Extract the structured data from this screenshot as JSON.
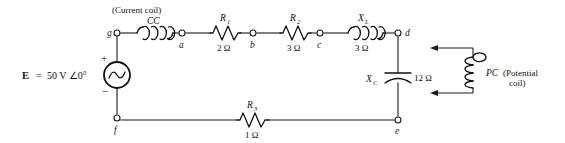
{
  "diagram": {
    "source": {
      "symbol_name": "ac-voltage-source",
      "label_e": "E",
      "label_equals": "=",
      "value": "50 V ∠0°",
      "plus_sign": "+",
      "minus_sign": "−"
    },
    "components": [
      {
        "id": "cc",
        "kind": "inductor",
        "label": "CC",
        "caption": "(Current coil)",
        "value": ""
      },
      {
        "id": "r1",
        "kind": "resistor",
        "label": "R",
        "subscript": "1",
        "value": "2 Ω"
      },
      {
        "id": "r2",
        "kind": "resistor",
        "label": "R",
        "subscript": "2",
        "value": "3 Ω"
      },
      {
        "id": "xl",
        "kind": "inductor",
        "label": "X",
        "subscript": "L",
        "value": "3 Ω"
      },
      {
        "id": "xc",
        "kind": "capacitor",
        "label": "X",
        "subscript": "C",
        "value": "12 Ω"
      },
      {
        "id": "r3",
        "kind": "resistor",
        "label": "R",
        "subscript": "3",
        "value": "1 Ω"
      },
      {
        "id": "pc",
        "kind": "inductor",
        "label": "PC",
        "caption_line1": "(Potential",
        "caption_line2": "coil)",
        "value": ""
      }
    ],
    "nodes": [
      {
        "id": "g",
        "label": "g"
      },
      {
        "id": "a",
        "label": "a"
      },
      {
        "id": "b",
        "label": "b"
      },
      {
        "id": "c",
        "label": "c"
      },
      {
        "id": "d",
        "label": "d"
      },
      {
        "id": "e",
        "label": "e"
      },
      {
        "id": "f",
        "label": "f"
      }
    ],
    "colors": {
      "background": "#ffffff",
      "wire": "#1a1a1a",
      "component": "#111111",
      "text": "#111111"
    }
  }
}
